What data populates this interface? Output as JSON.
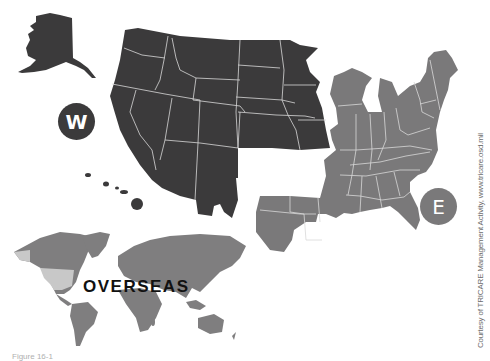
{
  "map": {
    "title": "TRICARE regions map",
    "regions": [
      {
        "id": "west",
        "badge": "W",
        "color": "#3b3a3b",
        "label": "West region (incl. Alaska and Hawaii)"
      },
      {
        "id": "east",
        "badge": "E",
        "color": "#7a797a",
        "label": "East region"
      },
      {
        "id": "overseas",
        "label": "OVERSEAS",
        "color": "#7f7e7f",
        "us_highlight_color": "#c8c8c8"
      }
    ],
    "credit": "Courtesy of TRICARE Management Activity, www.tricare.osd.mil",
    "caption_partial": "Figure 16-1"
  },
  "colors": {
    "background": "#ffffff",
    "west_fill": "#3b3a3b",
    "east_fill": "#7a797a",
    "world_fill": "#7f7e7f",
    "us_on_world": "#c8c8c8",
    "border_lines": "#d8d8d8",
    "label_text": "#111111"
  }
}
